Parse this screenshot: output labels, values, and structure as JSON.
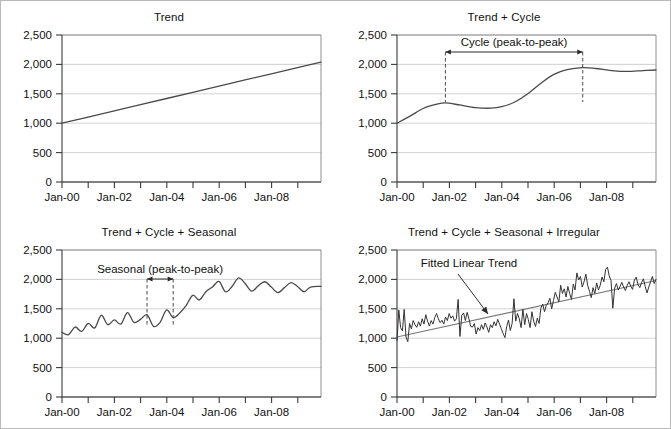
{
  "figure": {
    "background": "#ffffff",
    "border_color": "#b9b9b9",
    "series_color": "#4a4a4a",
    "grid_color": "#d2d2d2",
    "axis_color": "#3a3a3a",
    "fit_color": "#7b7b7b"
  },
  "axis": {
    "y_ticks": [
      "0",
      "500",
      "1,000",
      "1,500",
      "2,000",
      "2,500"
    ],
    "y_values": [
      0,
      500,
      1000,
      1500,
      2000,
      2500
    ],
    "x_ticks": [
      "Jan-00",
      "Jan-02",
      "Jan-04",
      "Jan-06",
      "Jan-08"
    ],
    "x_tick_years": [
      2000,
      2002,
      2004,
      2006,
      2008
    ],
    "x_minor_years": [
      2000,
      2001,
      2002,
      2003,
      2004,
      2005,
      2006,
      2007,
      2008,
      2009
    ]
  },
  "panels": [
    {
      "id": "trend",
      "title": "Trend",
      "annotation": null
    },
    {
      "id": "trend-cycle",
      "title": "Trend + Cycle",
      "annotation": {
        "label": "Cycle (peak-to-peak)",
        "start_year": 2001.85,
        "end_year": 2007.1
      }
    },
    {
      "id": "trend-cycle-seasonal",
      "title": "Trend + Cycle + Seasonal",
      "annotation": {
        "label": "Seasonal (peak-to-peak)",
        "start_year": 2003.25,
        "end_year": 2004.25
      }
    },
    {
      "id": "trend-cycle-seasonal-irregular",
      "title": "Trend + Cycle + Seasonal + Irregular",
      "annotation": {
        "label": "Fitted Linear Trend"
      }
    }
  ],
  "chart_data": [
    {
      "type": "line",
      "title": "Trend",
      "xlabel": "",
      "ylabel": "",
      "ylim": [
        0,
        2500
      ],
      "xlim": [
        2000,
        2009.9
      ],
      "grid": true,
      "legend": "none",
      "x": [
        2000,
        2001,
        2002,
        2003,
        2004,
        2005,
        2006,
        2007,
        2008,
        2009,
        2009.9
      ],
      "series": [
        {
          "name": "Trend",
          "values": [
            1000,
            1105,
            1210,
            1315,
            1420,
            1525,
            1630,
            1735,
            1840,
            1945,
            2040
          ]
        }
      ],
      "notes": "Straight linear trend from 1,000 at Jan-00 rising to about 2,040 at end of 2009."
    },
    {
      "type": "line",
      "title": "Trend + Cycle",
      "xlabel": "",
      "ylabel": "",
      "ylim": [
        0,
        2500
      ],
      "xlim": [
        2000,
        2009.9
      ],
      "grid": true,
      "legend": "none",
      "annotations": [
        {
          "text": "Cycle (peak-to-peak)",
          "from_year": 2001.85,
          "to_year": 2007.1,
          "y": 2180,
          "style": "double-arrow-with-dashed-drops"
        }
      ],
      "x": [
        2000,
        2000.5,
        2001,
        2001.5,
        2001.85,
        2002.4,
        2003,
        2003.6,
        2004,
        2004.5,
        2005,
        2005.5,
        2006,
        2006.5,
        2007.1,
        2007.6,
        2008.2,
        2008.8,
        2009.4,
        2009.9
      ],
      "series": [
        {
          "name": "Trend + Cycle",
          "values": [
            1000,
            1120,
            1250,
            1320,
            1345,
            1310,
            1265,
            1255,
            1280,
            1360,
            1500,
            1680,
            1830,
            1910,
            1945,
            1930,
            1895,
            1880,
            1895,
            1905
          ]
        }
      ],
      "notes": "Smooth cycle superimposed on trend, peaks near Jan-02 (1,345) and early 2007 (1,945)."
    },
    {
      "type": "line",
      "title": "Trend + Cycle + Seasonal",
      "xlabel": "",
      "ylabel": "",
      "ylim": [
        0,
        2500
      ],
      "xlim": [
        2000,
        2009.9
      ],
      "grid": true,
      "legend": "none",
      "annotations": [
        {
          "text": "Seasonal (peak-to-peak)",
          "from_year": 2003.25,
          "to_year": 2004.25,
          "y": 2090,
          "style": "double-arrow-with-dashed-drops"
        }
      ],
      "x": [
        2000,
        2000.25,
        2000.5,
        2000.75,
        2001,
        2001.25,
        2001.5,
        2001.75,
        2002,
        2002.25,
        2002.5,
        2002.75,
        2003,
        2003.25,
        2003.5,
        2003.75,
        2004,
        2004.25,
        2004.5,
        2004.75,
        2005,
        2005.25,
        2005.5,
        2005.75,
        2006,
        2006.25,
        2006.5,
        2006.75,
        2007,
        2007.25,
        2007.5,
        2007.75,
        2008,
        2008.25,
        2008.5,
        2008.75,
        2009,
        2009.25,
        2009.5,
        2009.9
      ],
      "series": [
        {
          "name": "Trend + Cycle + Seasonal",
          "values": [
            1100,
            1060,
            1190,
            1115,
            1250,
            1175,
            1390,
            1230,
            1310,
            1240,
            1435,
            1270,
            1320,
            1400,
            1200,
            1270,
            1480,
            1350,
            1430,
            1560,
            1730,
            1650,
            1790,
            1870,
            1965,
            1790,
            1880,
            2025,
            1930,
            1800,
            1890,
            1960,
            1870,
            1775,
            1860,
            1945,
            1880,
            1790,
            1870,
            1880
          ]
        }
      ],
      "notes": "Seasonal oscillation of roughly one year period riding on the trend-plus-cycle path."
    },
    {
      "type": "line",
      "title": "Trend + Cycle + Seasonal + Irregular",
      "xlabel": "",
      "ylabel": "",
      "ylim": [
        0,
        2500
      ],
      "xlim": [
        2000,
        2009.9
      ],
      "grid": true,
      "legend": "none",
      "annotations": [
        {
          "text": "Fitted Linear Trend",
          "style": "arrow-to-line",
          "text_year": 2001.6,
          "text_y": 2180,
          "tip_year": 2003.9,
          "tip_y": 1490
        }
      ],
      "series": [
        {
          "name": "Observed",
          "values": [
            960,
            1480,
            1180,
            1125,
            1490,
            1020,
            940,
            1250,
            1160,
            1300,
            1230,
            1185,
            1280,
            1205,
            1330,
            1240,
            1400,
            1290,
            1205,
            1300,
            1240,
            1350,
            1420,
            1330,
            1265,
            1305,
            1240,
            1360,
            1300,
            1420,
            1340,
            1380,
            1290,
            1330,
            1660,
            1030,
            1390,
            1430,
            1300,
            1440,
            1330,
            1200,
            1190,
            1250,
            1070,
            1180,
            1130,
            1230,
            1150,
            1260,
            1190,
            1100,
            1230,
            1180,
            1280,
            1210,
            1320,
            1240,
            1160,
            1080,
            1010,
            1200,
            1310,
            1130,
            1250,
            1670,
            1290,
            1420,
            1330,
            1180,
            1490,
            1230,
            1420,
            1320,
            1180,
            1450,
            1290,
            1200,
            1340,
            1250,
            1510,
            1580,
            1450,
            1560,
            1600,
            1680,
            1500,
            1640,
            1780,
            1700,
            1620,
            1900,
            1760,
            1840,
            1700,
            1880,
            1760,
            1660,
            1920,
            1820,
            2110,
            1990,
            2050,
            1870,
            1960,
            2090,
            1900,
            1800,
            1690,
            1860,
            1760,
            1940,
            1820,
            1900,
            2040,
            1960,
            2170,
            2210,
            2060,
            1980,
            1510,
            1850,
            1930,
            1820,
            1880,
            1950,
            1870,
            1810,
            1900,
            1960,
            1880,
            1830,
            1990,
            2040,
            1910,
            1860,
            1950,
            2010,
            1880,
            1770,
            1870,
            1960,
            2050,
            1930,
            2000
          ]
        },
        {
          "name": "Fitted Linear Trend",
          "start_value": 1020,
          "end_value": 1980
        }
      ],
      "notes": "Noisy monthly observations from Jan-00 to late 2009 with an upward fitted linear trend from about 1,020 to 1,980."
    }
  ]
}
